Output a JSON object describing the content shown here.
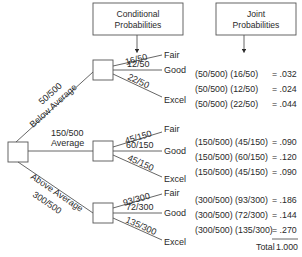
{
  "headers": {
    "conditional": [
      "Conditional",
      "Probabilities"
    ],
    "joint": [
      "Joint",
      "Probabilities"
    ]
  },
  "first_stage": [
    {
      "prob": "50/500",
      "label": "Below Average"
    },
    {
      "prob": "150/500",
      "label": "Average"
    },
    {
      "prob": "300/500",
      "label": "Above Average"
    }
  ],
  "second_stage": [
    {
      "branches": [
        {
          "prob": "16/50",
          "outcome": "Fair"
        },
        {
          "prob": "12/50",
          "outcome": "Good"
        },
        {
          "prob": "22/50",
          "outcome": "Excel"
        }
      ]
    },
    {
      "branches": [
        {
          "prob": "45/150",
          "outcome": "Fair"
        },
        {
          "prob": "60/150",
          "outcome": "Good"
        },
        {
          "prob": "45/150",
          "outcome": "Excel"
        }
      ]
    },
    {
      "branches": [
        {
          "prob": "93/300",
          "outcome": "Fair"
        },
        {
          "prob": "72/300",
          "outcome": "Good"
        },
        {
          "prob": "135/300",
          "outcome": "Excel"
        }
      ]
    }
  ],
  "joint_rows": [
    {
      "expr": "(50/500) (16/50)",
      "value": "= .032"
    },
    {
      "expr": "(50/500) (12/50)",
      "value": "= .024"
    },
    {
      "expr": "(50/500) (22/50)",
      "value": "= .044"
    },
    {
      "expr": "(150/500) (45/150)",
      "value": "= .090"
    },
    {
      "expr": "(150/500) (60/150)",
      "value": "= .120"
    },
    {
      "expr": "(150/500) (45/150)",
      "value": "= .090"
    },
    {
      "expr": "(300/500) (93/300)",
      "value": "= .186"
    },
    {
      "expr": "(300/500) (72/300)",
      "value": "= .144"
    },
    {
      "expr": "(300/500) (135/300)",
      "value": "= .270"
    }
  ],
  "total": {
    "label": "Total",
    "value": "1.000"
  }
}
